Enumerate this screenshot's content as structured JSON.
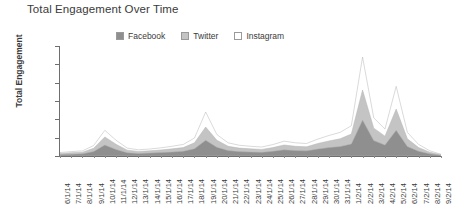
{
  "chart": {
    "title": "Total Engagement Over Time",
    "y_axis_title": "Total Engagement"
  },
  "legend": {
    "items": [
      {
        "label": "Facebook",
        "color": "#8f8f8f",
        "name": "legend-item-facebook"
      },
      {
        "label": "Twitter",
        "color": "#c4c4c4",
        "name": "legend-item-twitter"
      },
      {
        "label": "Instagram",
        "color": "#ffffff",
        "name": "legend-item-instagram"
      }
    ]
  },
  "chart_data": {
    "type": "area",
    "stacked": true,
    "title": "Total Engagement Over Time",
    "xlabel": "",
    "ylabel": "Total Engagement",
    "ylim": [
      0,
      3000000
    ],
    "ytick_labels": [
      "3.0M",
      "2.5M",
      "2.0M",
      "1.5M",
      "1.0M",
      "500.0K",
      "0"
    ],
    "ytick_values": [
      3000000,
      2500000,
      2000000,
      1500000,
      1000000,
      500000,
      0
    ],
    "grid": false,
    "legend_position": "top-center",
    "categories": [
      "6/1/14",
      "7/1/14",
      "8/1/14",
      "9/1/14",
      "10/1/14",
      "11/1/14",
      "12/1/14",
      "13/1/14",
      "14/1/14",
      "15/1/14",
      "16/1/14",
      "17/1/14",
      "18/1/14",
      "19/1/14",
      "20/1/14",
      "21/1/14",
      "22/1/14",
      "23/1/14",
      "24/1/14",
      "25/1/14",
      "26/1/14",
      "27/1/14",
      "28/1/14",
      "29/1/14",
      "30/1/14",
      "31/1/14",
      "1/2/14",
      "2/2/14",
      "3/2/14",
      "4/2/14",
      "5/2/14",
      "6/2/14",
      "7/2/14",
      "8/2/14",
      "9/2/14"
    ],
    "series": [
      {
        "name": "Facebook",
        "color": "#8f8f8f",
        "values": [
          40000,
          50000,
          60000,
          120000,
          300000,
          180000,
          90000,
          70000,
          80000,
          95000,
          110000,
          130000,
          200000,
          430000,
          240000,
          150000,
          120000,
          110000,
          100000,
          130000,
          170000,
          150000,
          140000,
          190000,
          230000,
          260000,
          330000,
          980000,
          420000,
          300000,
          700000,
          260000,
          130000,
          60000,
          20000
        ]
      },
      {
        "name": "Twitter",
        "color": "#c4c4c4",
        "values": [
          30000,
          40000,
          45000,
          90000,
          220000,
          140000,
          70000,
          55000,
          60000,
          70000,
          85000,
          100000,
          160000,
          360000,
          190000,
          115000,
          95000,
          85000,
          80000,
          100000,
          130000,
          115000,
          110000,
          150000,
          180000,
          210000,
          270000,
          820000,
          340000,
          240000,
          580000,
          210000,
          100000,
          45000,
          15000
        ]
      },
      {
        "name": "Instagram",
        "color": "#ffffff",
        "values": [
          25000,
          30000,
          35000,
          75000,
          180000,
          110000,
          55000,
          45000,
          50000,
          58000,
          70000,
          85000,
          130000,
          410000,
          155000,
          95000,
          78000,
          70000,
          65000,
          82000,
          105000,
          95000,
          90000,
          120000,
          150000,
          175000,
          225000,
          900000,
          280000,
          195000,
          620000,
          175000,
          85000,
          38000,
          12000
        ]
      }
    ]
  }
}
